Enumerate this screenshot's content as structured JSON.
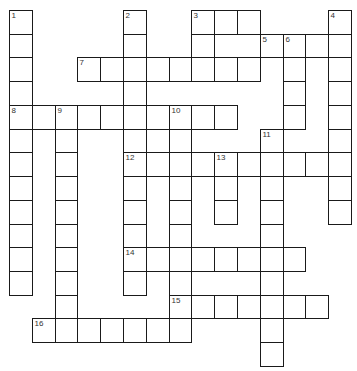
{
  "puzzle": {
    "grid": {
      "origin_x": 9,
      "origin_y": 10,
      "cell_w": 22.8,
      "cell_h": 23.73,
      "cols": 15,
      "rows": 15
    },
    "colors": {
      "line": "#1a1a1a",
      "cell_fill": "#ffffff",
      "number": "#333333",
      "background": "#ffffff"
    },
    "entries": [
      {
        "number": "1",
        "direction": "down",
        "col": 0,
        "row": 0,
        "length": 12
      },
      {
        "number": "2",
        "direction": "down",
        "col": 5,
        "row": 0,
        "length": 12
      },
      {
        "number": "3",
        "direction": "across",
        "col": 8,
        "row": 0,
        "length": 3
      },
      {
        "number": "3",
        "direction": "down",
        "col": 8,
        "row": 0,
        "length": 3
      },
      {
        "number": "4",
        "direction": "down",
        "col": 14,
        "row": 0,
        "length": 9
      },
      {
        "number": "5",
        "direction": "across",
        "col": 11,
        "row": 1,
        "length": 4
      },
      {
        "number": "6",
        "direction": "down",
        "col": 12,
        "row": 1,
        "length": 4
      },
      {
        "number": "7",
        "direction": "across",
        "col": 3,
        "row": 2,
        "length": 8
      },
      {
        "number": "8",
        "direction": "across",
        "col": 0,
        "row": 4,
        "length": 10
      },
      {
        "number": "9",
        "direction": "down",
        "col": 2,
        "row": 4,
        "length": 10
      },
      {
        "number": "10",
        "direction": "down",
        "col": 7,
        "row": 4,
        "length": 10
      },
      {
        "number": "11",
        "direction": "down",
        "col": 11,
        "row": 5,
        "length": 10
      },
      {
        "number": "12",
        "direction": "across",
        "col": 5,
        "row": 6,
        "length": 10
      },
      {
        "number": "13",
        "direction": "down",
        "col": 9,
        "row": 6,
        "length": 3
      },
      {
        "number": "14",
        "direction": "across",
        "col": 5,
        "row": 10,
        "length": 8
      },
      {
        "number": "15",
        "direction": "across",
        "col": 7,
        "row": 12,
        "length": 7
      },
      {
        "number": "16",
        "direction": "across",
        "col": 1,
        "row": 13,
        "length": 7
      }
    ],
    "numbers": [
      {
        "label": "1",
        "col": 0,
        "row": 0
      },
      {
        "label": "2",
        "col": 5,
        "row": 0
      },
      {
        "label": "3",
        "col": 8,
        "row": 0
      },
      {
        "label": "4",
        "col": 14,
        "row": 0
      },
      {
        "label": "5",
        "col": 11,
        "row": 1
      },
      {
        "label": "6",
        "col": 12,
        "row": 1
      },
      {
        "label": "7",
        "col": 3,
        "row": 2
      },
      {
        "label": "8",
        "col": 0,
        "row": 4
      },
      {
        "label": "9",
        "col": 2,
        "row": 4
      },
      {
        "label": "10",
        "col": 7,
        "row": 4
      },
      {
        "label": "11",
        "col": 11,
        "row": 5
      },
      {
        "label": "12",
        "col": 5,
        "row": 6
      },
      {
        "label": "13",
        "col": 9,
        "row": 6
      },
      {
        "label": "14",
        "col": 5,
        "row": 10
      },
      {
        "label": "15",
        "col": 7,
        "row": 12
      },
      {
        "label": "16",
        "col": 1,
        "row": 13
      }
    ],
    "letters": {}
  }
}
